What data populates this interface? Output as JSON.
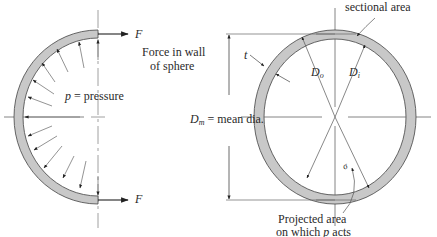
{
  "figure": {
    "left": {
      "force_top_label": "F",
      "force_bottom_label": "F",
      "force_caption_line1": "Force in wall",
      "force_caption_line2": "of sphere",
      "pressure_symbol": "p",
      "pressure_text": " = pressure"
    },
    "right": {
      "sectional_area_label": "sectional area",
      "thickness_label": "t",
      "outer_dia_symbol": "D",
      "outer_dia_sub": "o",
      "inner_dia_symbol": "D",
      "inner_dia_sub": "i",
      "mean_dia_symbol": "D",
      "mean_dia_sub": "m",
      "mean_dia_text": " = mean dia.",
      "sigma_label": "σ",
      "projected_line1": "Projected area",
      "projected_line2_prefix": "on which ",
      "projected_line2_symbol": "p",
      "projected_line2_suffix": " acts"
    },
    "colors": {
      "wall_fill": "#c8c8c8",
      "wall_stroke": "#555555",
      "line": "#333333",
      "thin_line": "#666666"
    }
  }
}
